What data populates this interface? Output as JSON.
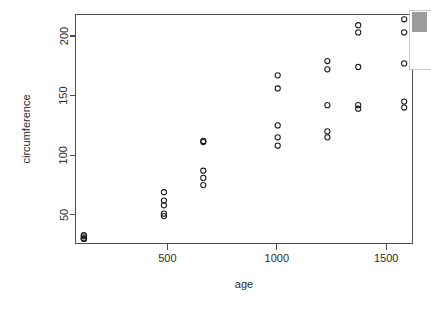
{
  "chart_data": {
    "type": "scatter",
    "title": "",
    "xlabel": "age",
    "ylabel": "circumference",
    "xlim": [
      80,
      1620
    ],
    "ylim": [
      26,
      218
    ],
    "grid": false,
    "legend": null,
    "xticks": [
      500,
      1000,
      1500
    ],
    "xtick_labels": [
      "500",
      "1000",
      "1500"
    ],
    "yticks": [
      50,
      100,
      150,
      200
    ],
    "ytick_labels": [
      "50",
      "100",
      "150",
      "200"
    ],
    "marker": "open-circle",
    "marker_color": "#1a1a1a",
    "points": [
      {
        "x": 118,
        "y": 30
      },
      {
        "x": 118,
        "y": 33
      },
      {
        "x": 118,
        "y": 30
      },
      {
        "x": 118,
        "y": 32
      },
      {
        "x": 118,
        "y": 30
      },
      {
        "x": 484,
        "y": 58
      },
      {
        "x": 484,
        "y": 69
      },
      {
        "x": 484,
        "y": 51
      },
      {
        "x": 484,
        "y": 62
      },
      {
        "x": 484,
        "y": 49
      },
      {
        "x": 664,
        "y": 87
      },
      {
        "x": 664,
        "y": 111
      },
      {
        "x": 664,
        "y": 75
      },
      {
        "x": 664,
        "y": 112
      },
      {
        "x": 664,
        "y": 81
      },
      {
        "x": 1004,
        "y": 115
      },
      {
        "x": 1004,
        "y": 156
      },
      {
        "x": 1004,
        "y": 108
      },
      {
        "x": 1004,
        "y": 167
      },
      {
        "x": 1004,
        "y": 125
      },
      {
        "x": 1231,
        "y": 120
      },
      {
        "x": 1231,
        "y": 172
      },
      {
        "x": 1231,
        "y": 115
      },
      {
        "x": 1231,
        "y": 179
      },
      {
        "x": 1231,
        "y": 142
      },
      {
        "x": 1372,
        "y": 142
      },
      {
        "x": 1372,
        "y": 203
      },
      {
        "x": 1372,
        "y": 139
      },
      {
        "x": 1372,
        "y": 209
      },
      {
        "x": 1372,
        "y": 174
      },
      {
        "x": 1582,
        "y": 145
      },
      {
        "x": 1582,
        "y": 203
      },
      {
        "x": 1582,
        "y": 140
      },
      {
        "x": 1582,
        "y": 214
      },
      {
        "x": 1582,
        "y": 177
      }
    ]
  },
  "axes": {
    "x_title": "age",
    "y_title": "circumference"
  }
}
